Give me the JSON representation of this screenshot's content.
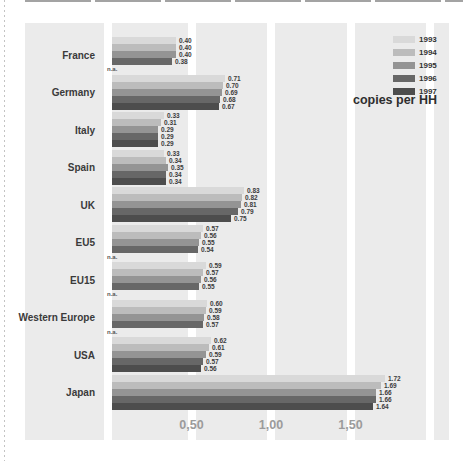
{
  "page": {
    "background": "#ffffff"
  },
  "chart_data": {
    "type": "bar",
    "orientation": "horizontal",
    "title": "",
    "unit_label": "copies per HH",
    "na_label": "n.a.",
    "plot_bg": "#ebebeb",
    "gridline_color": "#ffffff",
    "xlim": [
      0,
      2.1
    ],
    "gridline_values": [
      0,
      0.5,
      1.0,
      1.5,
      2.0
    ],
    "x_ticks": [
      {
        "value": 0.5,
        "label": "0,50"
      },
      {
        "value": 1.0,
        "label": "1,00"
      },
      {
        "value": 1.5,
        "label": "1,50"
      }
    ],
    "categories": [
      "France",
      "Germany",
      "Italy",
      "Spain",
      "UK",
      "EU5",
      "EU15",
      "Western Europe",
      "USA",
      "Japan"
    ],
    "series": [
      {
        "name": "1993",
        "color": "#d9d9d9",
        "values": [
          0.4,
          0.71,
          0.33,
          0.33,
          0.83,
          0.57,
          0.59,
          0.6,
          0.62,
          1.72
        ]
      },
      {
        "name": "1994",
        "color": "#bcbcbc",
        "values": [
          0.4,
          0.7,
          0.31,
          0.34,
          0.82,
          0.56,
          0.57,
          0.59,
          0.61,
          1.69
        ]
      },
      {
        "name": "1995",
        "color": "#949494",
        "values": [
          0.4,
          0.69,
          0.29,
          0.35,
          0.81,
          0.55,
          0.56,
          0.58,
          0.59,
          1.66
        ]
      },
      {
        "name": "1996",
        "color": "#676767",
        "values": [
          0.38,
          0.68,
          0.29,
          0.34,
          0.79,
          0.54,
          0.55,
          0.57,
          0.57,
          1.66
        ]
      },
      {
        "name": "1997",
        "color": "#4d4d4d",
        "values": [
          null,
          0.67,
          0.29,
          0.34,
          0.75,
          null,
          null,
          null,
          0.56,
          1.64
        ]
      }
    ],
    "legend_position": "top-right"
  }
}
